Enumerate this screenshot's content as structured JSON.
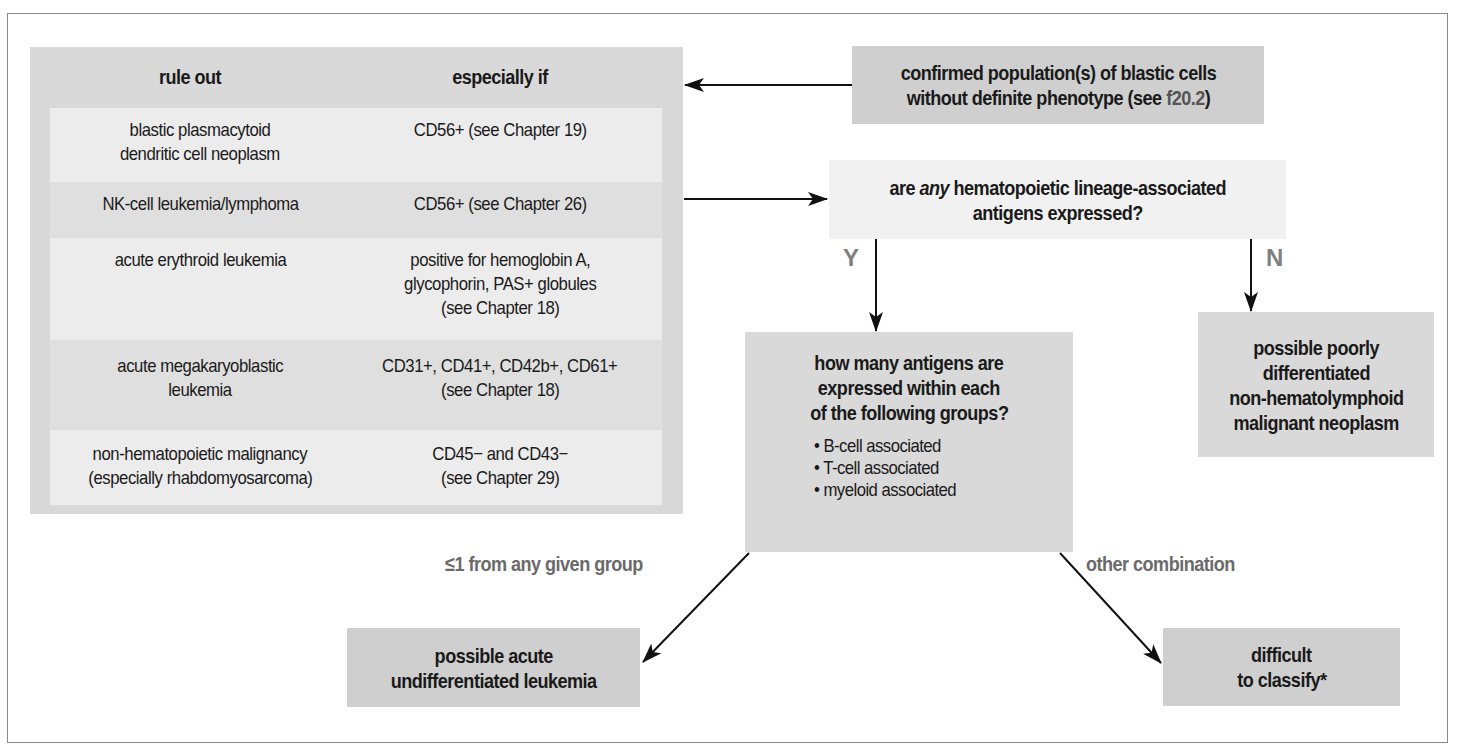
{
  "table": {
    "headers": [
      "rule out",
      "especially if"
    ],
    "rows": [
      {
        "rule_out": [
          "blastic plasmacytoid",
          "dendritic cell neoplasm"
        ],
        "especially_if": [
          "CD56+ (see Chapter 19)"
        ]
      },
      {
        "rule_out": [
          "NK-cell leukemia/lymphoma"
        ],
        "especially_if": [
          "CD56+ (see Chapter 26)"
        ]
      },
      {
        "rule_out": [
          "acute erythroid leukemia"
        ],
        "especially_if": [
          "positive for hemoglobin A,",
          "glycophorin, PAS+ globules",
          "(see Chapter 18)"
        ]
      },
      {
        "rule_out": [
          "acute megakaryoblastic",
          "leukemia"
        ],
        "especially_if": [
          "CD31+, CD41+, CD42b+, CD61+",
          "(see Chapter 18)"
        ]
      },
      {
        "rule_out": [
          "non-hematopoietic malignancy",
          "(especially rhabdomyosarcoma)"
        ],
        "especially_if": [
          "CD45− and CD43−",
          "(see Chapter 29)"
        ]
      }
    ]
  },
  "nodes": {
    "start": {
      "line1": "confirmed population(s) of  blastic cells",
      "line2_pre": "without definite phenotype (see ",
      "line2_ref": "f20.2",
      "line2_post": ")"
    },
    "question1": {
      "pre": "are ",
      "emph": "any",
      "post": " hematopoietic lineage-associated",
      "line2": "antigens expressed?"
    },
    "question2": {
      "lines": [
        "how many antigens are",
        "expressed within each",
        "of the following groups?"
      ],
      "bullets": [
        "• B-cell associated",
        "• T-cell associated",
        "• myeloid associated"
      ]
    },
    "no_result": {
      "lines": [
        "possible poorly",
        "differentiated",
        "non-hematolymphoid",
        "malignant neoplasm"
      ]
    },
    "aul_result": {
      "lines": [
        "possible acute",
        "undifferentiated leukemia"
      ]
    },
    "other_result": {
      "lines": [
        "difficult",
        "to classify*"
      ]
    }
  },
  "edge_labels": {
    "yes": "Y",
    "no": "N",
    "le1": "≤1 from any given group",
    "other": "other combination"
  },
  "colors": {
    "frame": "#8a8a8a",
    "table_bg": "#d9d9d9",
    "row_light": "#ececec",
    "row_mid": "#dfdfdf",
    "box_dark": "#cfcfcf",
    "box_pale": "#f1f1f1",
    "label_gray": "#6a6a6a",
    "arrow": "#111111"
  }
}
